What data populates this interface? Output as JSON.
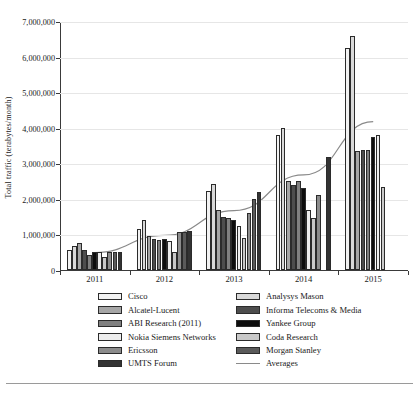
{
  "chart_data": {
    "type": "bar",
    "title": "",
    "xlabel": "",
    "ylabel": "Total traffic (terabytes/month)",
    "categories": [
      "2011",
      "2012",
      "2013",
      "2014",
      "2015"
    ],
    "ylim": [
      0,
      7000000
    ],
    "ytick_values": [
      0,
      1000000,
      2000000,
      3000000,
      4000000,
      5000000,
      6000000,
      7000000
    ],
    "ytick_labels": [
      "0",
      "1,000,000",
      "2,000,000",
      "3,000,000",
      "4,000,000",
      "5,000,000",
      "6,000,000",
      "7,000,000"
    ],
    "grid": true,
    "legend_position": "below",
    "series": [
      {
        "name": "Cisco",
        "color": "#f2f2f2",
        "values": [
          560000,
          1150000,
          2220000,
          3800000,
          6230000
        ]
      },
      {
        "name": "Analysys Mason",
        "color": "#d9d9d9",
        "values": [
          680000,
          1410000,
          2420000,
          3980000,
          6580000
        ]
      },
      {
        "name": "Alcatel-Lucent",
        "color": "#a6a6a6",
        "values": [
          750000,
          950000,
          1680000,
          2500000,
          3350000
        ]
      },
      {
        "name": "Informa Telecoms & Media",
        "color": "#4d4d4d",
        "values": [
          550000,
          860000,
          1500000,
          2400000,
          3380000
        ]
      },
      {
        "name": "ABI Research (2011)",
        "color": "#808080",
        "values": [
          420000,
          840000,
          1470000,
          2500000,
          3380000
        ]
      },
      {
        "name": "Yankee Group",
        "color": "#0d0d0d",
        "values": [
          510000,
          880000,
          1420000,
          2300000,
          3750000
        ]
      },
      {
        "name": "Nokia Siemens Networks",
        "color": "#ededed",
        "values": [
          500000,
          810000,
          1230000,
          1680000,
          3800000
        ]
      },
      {
        "name": "Coda Research",
        "color": "#c9c9c9",
        "values": [
          370000,
          520000,
          900000,
          1460000,
          2330000
        ]
      },
      {
        "name": "Ericsson",
        "color": "#8c8c8c",
        "values": [
          520000,
          1070000,
          1600000,
          2120000,
          null
        ]
      },
      {
        "name": "Morgan Stanley",
        "color": "#5a5a5a",
        "values": [
          520000,
          1080000,
          2000000,
          null,
          null
        ]
      },
      {
        "name": "UMTS Forum",
        "color": "#333333",
        "values": [
          500000,
          1100000,
          2200000,
          3170000,
          null
        ]
      }
    ],
    "overlay_line": {
      "name": "Averages",
      "color": "#8a8a8a",
      "values": [
        520000,
        1000000,
        1700000,
        2700000,
        4200000
      ]
    }
  },
  "legend": {
    "left_column": [
      {
        "label": "Cisco",
        "swatch": "swatch-cisco"
      },
      {
        "label": "Alcatel-Lucent",
        "swatch": "swatch-alcatel"
      },
      {
        "label": "ABI Research (2011)",
        "swatch": "swatch-abi"
      },
      {
        "label": "Nokia Siemens Networks",
        "swatch": "swatch-nokia"
      },
      {
        "label": "Ericsson",
        "swatch": "swatch-ericsson"
      },
      {
        "label": "UMTS Forum",
        "swatch": "swatch-umts"
      }
    ],
    "right_column": [
      {
        "label": "Analysys Mason",
        "swatch": "swatch-analysys"
      },
      {
        "label": "Informa Telecoms & Media",
        "swatch": "swatch-informa"
      },
      {
        "label": "Yankee Group",
        "swatch": "swatch-yankee"
      },
      {
        "label": "Coda Research",
        "swatch": "swatch-coda"
      },
      {
        "label": "Morgan Stanley",
        "swatch": "swatch-morgan"
      },
      {
        "label": "Averages",
        "swatch": "swatch-averages-line"
      }
    ]
  },
  "colors": {
    "axis": "#3a3a3a",
    "grid": "#e6e6e6",
    "bar_outline": "#2b2b2b",
    "trendline": "#8a8a8a",
    "background": "#ffffff"
  }
}
